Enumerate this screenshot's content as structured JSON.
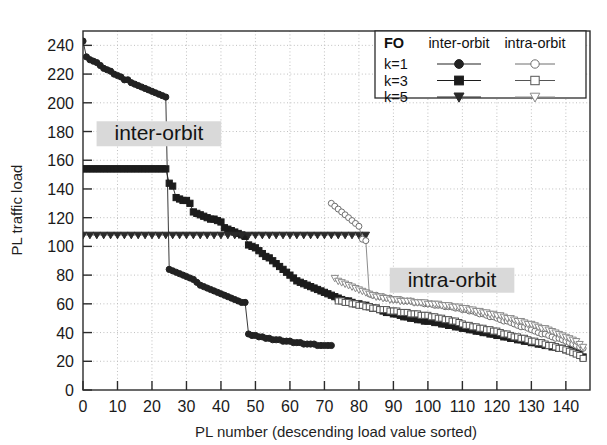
{
  "chart_data": {
    "type": "scatter",
    "title": "",
    "xlabel": "PL number (descending load value sorted)",
    "ylabel": "PL traffic load",
    "xlim": [
      0,
      147
    ],
    "ylim": [
      0,
      250
    ],
    "xticks": [
      0,
      10,
      20,
      30,
      40,
      50,
      60,
      70,
      80,
      90,
      100,
      110,
      120,
      130,
      140
    ],
    "yticks": [
      0,
      20,
      40,
      60,
      80,
      100,
      120,
      140,
      160,
      180,
      200,
      220,
      240
    ],
    "grid": true,
    "grid_style": "dotted",
    "legend": {
      "position": "top-right",
      "title": "FO",
      "columns": [
        "inter-orbit",
        "intra-orbit"
      ],
      "rows": [
        {
          "label": "k=1",
          "inter_marker": "filled-circle",
          "intra_marker": "open-circle"
        },
        {
          "label": "k=3",
          "inter_marker": "filled-square",
          "intra_marker": "open-square"
        },
        {
          "label": "k=5",
          "inter_marker": "filled-triangle-down",
          "intra_marker": "open-triangle-down"
        }
      ]
    },
    "annotations": [
      {
        "text": "inter-orbit",
        "x": 22,
        "y": 176
      },
      {
        "text": "intra-orbit",
        "x": 107,
        "y": 74
      }
    ],
    "series": [
      {
        "name": "inter-orbit k=1",
        "marker": "filled-circle",
        "filled": true,
        "color": "#222222",
        "x": [
          0,
          1,
          2,
          3,
          4,
          5,
          6,
          7,
          8,
          9,
          10,
          11,
          12,
          13,
          14,
          15,
          16,
          17,
          18,
          19,
          20,
          21,
          22,
          23,
          24,
          25,
          26,
          27,
          28,
          29,
          30,
          31,
          32,
          33,
          34,
          35,
          36,
          37,
          38,
          39,
          40,
          41,
          42,
          43,
          44,
          45,
          46,
          47,
          48,
          49,
          50,
          51,
          52,
          53,
          54,
          55,
          56,
          57,
          58,
          59,
          60,
          61,
          62,
          63,
          64,
          65,
          66,
          67,
          68,
          69,
          70,
          71,
          72
        ],
        "y": [
          243,
          232,
          230,
          229,
          228,
          226,
          224,
          223,
          222,
          220,
          219,
          218,
          216,
          216,
          214,
          213,
          212,
          211,
          210,
          209,
          208,
          207,
          206,
          205,
          204,
          84,
          83,
          82,
          81,
          80,
          79,
          78,
          77,
          75,
          73,
          72,
          71,
          70,
          69,
          68,
          67,
          66,
          65,
          64,
          63,
          62,
          61,
          61,
          39,
          38,
          38,
          37,
          37,
          36,
          36,
          35,
          35,
          35,
          34,
          34,
          34,
          33,
          33,
          33,
          32,
          32,
          32,
          32,
          31,
          31,
          31,
          31,
          31
        ]
      },
      {
        "name": "inter-orbit k=3",
        "marker": "filled-square",
        "filled": true,
        "color": "#1c1c1c",
        "x": [
          0,
          1,
          2,
          3,
          4,
          5,
          6,
          7,
          8,
          9,
          10,
          11,
          12,
          13,
          14,
          15,
          16,
          17,
          18,
          19,
          20,
          21,
          22,
          23,
          24,
          25,
          26,
          27,
          28,
          29,
          30,
          31,
          32,
          33,
          34,
          35,
          36,
          37,
          38,
          39,
          40,
          41,
          42,
          43,
          44,
          45,
          46,
          47,
          48,
          49,
          50,
          51,
          52,
          53,
          54,
          55,
          56,
          57,
          58,
          59,
          60,
          61,
          62,
          63,
          64,
          65,
          66,
          67,
          68,
          69,
          70,
          71,
          72,
          73,
          74,
          75,
          76,
          77,
          78,
          79,
          80,
          81,
          82,
          83,
          84,
          85,
          86,
          87,
          88,
          89,
          90,
          91,
          92,
          93,
          94,
          95,
          96,
          97,
          98,
          99,
          100,
          101,
          102,
          103,
          104,
          105,
          106,
          107,
          108,
          109,
          110,
          111,
          112,
          113,
          114,
          115,
          116,
          117,
          118,
          119,
          120,
          121,
          122,
          123,
          124,
          125,
          126,
          127,
          128,
          129,
          130,
          131,
          132,
          133,
          134,
          135,
          136,
          137,
          138,
          139,
          140,
          141,
          142,
          143,
          144,
          145
        ],
        "y": [
          154,
          154,
          154,
          154,
          154,
          154,
          154,
          154,
          154,
          154,
          154,
          154,
          154,
          154,
          154,
          154,
          154,
          154,
          154,
          154,
          154,
          154,
          154,
          154,
          154,
          144,
          142,
          134,
          133,
          132,
          132,
          130,
          124,
          123,
          122,
          121,
          120,
          119,
          119,
          118,
          117,
          113,
          112,
          111,
          110,
          109,
          108,
          107,
          101,
          100,
          99,
          97,
          95,
          93,
          92,
          90,
          88,
          86,
          84,
          82,
          80,
          78,
          76,
          75,
          74,
          73,
          72,
          71,
          70,
          69,
          68,
          67,
          66,
          65,
          64,
          63,
          62,
          62,
          61,
          60,
          60,
          59,
          59,
          58,
          57,
          57,
          56,
          55,
          54,
          54,
          53,
          53,
          52,
          51,
          51,
          50,
          50,
          49,
          49,
          48,
          48,
          48,
          47,
          47,
          46,
          46,
          45,
          45,
          44,
          44,
          43,
          43,
          42,
          42,
          41,
          41,
          40,
          40,
          39,
          39,
          38,
          38,
          37,
          37,
          36,
          36,
          35,
          35,
          34,
          34,
          33,
          33,
          32,
          32,
          31,
          31,
          30,
          30,
          29,
          29,
          28,
          28,
          27,
          26,
          25,
          23
        ]
      },
      {
        "name": "inter-orbit k=5",
        "marker": "filled-triangle-down",
        "filled": true,
        "color": "#2a2a2a",
        "x": [
          0,
          2,
          4,
          6,
          8,
          10,
          12,
          14,
          16,
          18,
          20,
          22,
          24,
          26,
          28,
          30,
          32,
          34,
          36,
          38,
          40,
          42,
          44,
          46,
          48,
          50,
          52,
          54,
          56,
          58,
          60,
          62,
          64,
          66,
          68,
          70,
          72,
          74,
          76,
          78,
          80,
          82
        ],
        "y": [
          108,
          108,
          108,
          108,
          108,
          108,
          108,
          108,
          108,
          108,
          108,
          108,
          108,
          108,
          108,
          108,
          108,
          108,
          108,
          108,
          108,
          108,
          108,
          108,
          108,
          108,
          108,
          108,
          108,
          108,
          108,
          108,
          108,
          108,
          108,
          108,
          108,
          108,
          108,
          108,
          108,
          108
        ]
      },
      {
        "name": "intra-orbit k=1",
        "marker": "open-circle",
        "filled": false,
        "color": "#6e6e6e",
        "x": [
          72,
          73,
          74,
          75,
          76,
          77,
          78,
          79,
          80,
          81,
          82,
          83,
          84,
          85,
          86,
          87,
          88,
          89,
          90,
          91,
          92,
          93,
          94,
          95,
          96,
          97,
          98,
          99,
          100,
          101,
          102,
          103,
          104,
          105,
          106,
          107,
          108,
          109,
          110,
          111,
          112,
          113,
          114,
          115,
          116,
          117,
          118,
          119,
          120,
          121,
          122,
          123,
          124,
          125,
          126,
          127,
          128,
          129,
          130,
          131,
          132,
          133,
          134,
          135,
          136,
          137,
          138,
          139,
          140,
          141,
          142,
          143,
          144,
          145
        ],
        "y": [
          130,
          128,
          126,
          124,
          122,
          120,
          118,
          116,
          114,
          105,
          104,
          67,
          66,
          66,
          65,
          65,
          64,
          64,
          63,
          63,
          63,
          62,
          62,
          62,
          61,
          61,
          61,
          60,
          60,
          60,
          59,
          59,
          59,
          58,
          58,
          58,
          57,
          57,
          56,
          56,
          55,
          55,
          54,
          53,
          53,
          52,
          51,
          51,
          50,
          49,
          48,
          48,
          47,
          46,
          45,
          44,
          44,
          43,
          42,
          41,
          40,
          39,
          39,
          38,
          37,
          36,
          36,
          35,
          34,
          33,
          32,
          31,
          30,
          29
        ]
      },
      {
        "name": "intra-orbit k=3",
        "marker": "open-square",
        "filled": false,
        "color": "#555555",
        "x": [
          74,
          75,
          76,
          77,
          78,
          79,
          80,
          81,
          82,
          83,
          84,
          85,
          86,
          87,
          88,
          89,
          90,
          91,
          92,
          93,
          94,
          95,
          96,
          97,
          98,
          99,
          100,
          101,
          102,
          103,
          104,
          105,
          106,
          107,
          108,
          109,
          110,
          111,
          112,
          113,
          114,
          115,
          116,
          117,
          118,
          119,
          120,
          121,
          122,
          123,
          124,
          125,
          126,
          127,
          128,
          129,
          130,
          131,
          132,
          133,
          134,
          135,
          136,
          137,
          138,
          139,
          140,
          141,
          142,
          143,
          144,
          145
        ],
        "y": [
          62,
          62,
          61,
          61,
          60,
          60,
          59,
          59,
          58,
          58,
          57,
          57,
          56,
          56,
          56,
          55,
          55,
          55,
          54,
          54,
          54,
          53,
          53,
          53,
          52,
          52,
          52,
          51,
          51,
          50,
          50,
          49,
          49,
          48,
          48,
          47,
          46,
          45,
          45,
          44,
          44,
          43,
          43,
          42,
          42,
          41,
          41,
          40,
          39,
          39,
          38,
          37,
          37,
          36,
          36,
          35,
          34,
          34,
          33,
          33,
          32,
          31,
          31,
          30,
          29,
          29,
          28,
          27,
          26,
          25,
          24,
          22
        ]
      },
      {
        "name": "intra-orbit k=5",
        "marker": "open-triangle-down",
        "filled": false,
        "color": "#8a8a8a",
        "x": [
          73,
          74,
          75,
          76,
          77,
          78,
          79,
          80,
          81,
          82,
          83,
          84,
          85,
          86,
          87,
          88,
          89,
          90,
          91,
          92,
          93,
          94,
          95,
          96,
          97,
          98,
          99,
          100,
          101,
          102,
          103,
          104,
          105,
          106,
          107,
          108,
          109,
          110,
          111,
          112,
          113,
          114,
          115,
          116,
          117,
          118,
          119,
          120,
          121,
          122,
          123,
          124,
          125,
          126,
          127,
          128,
          129,
          130,
          131,
          132,
          133,
          134,
          135,
          136,
          137,
          138,
          139,
          140,
          141,
          142,
          143,
          144,
          145
        ],
        "y": [
          78,
          76,
          75,
          74,
          73,
          72,
          71,
          70,
          69,
          68,
          67,
          66,
          65,
          65,
          64,
          64,
          63,
          63,
          63,
          62,
          62,
          62,
          62,
          61,
          61,
          61,
          61,
          60,
          60,
          60,
          60,
          59,
          59,
          59,
          58,
          58,
          58,
          57,
          57,
          56,
          56,
          55,
          55,
          54,
          54,
          53,
          53,
          52,
          52,
          51,
          50,
          50,
          49,
          48,
          48,
          47,
          46,
          46,
          45,
          44,
          43,
          43,
          42,
          41,
          40,
          39,
          38,
          37,
          36,
          35,
          34,
          32,
          30
        ]
      }
    ]
  }
}
